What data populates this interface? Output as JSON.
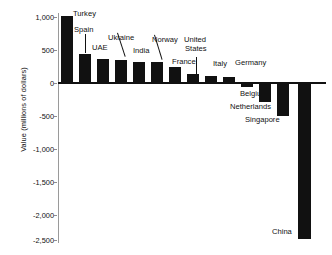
{
  "chart_data": {
    "type": "bar",
    "title": "",
    "xlabel": "",
    "ylabel": "Value (millions of dollars)",
    "ylim": [
      -2500,
      1000
    ],
    "grid": false,
    "legend": null,
    "ytick_labels": [
      "1,000",
      "500",
      "0",
      "-500",
      "-1,000",
      "-1,500",
      "-2,000",
      "-2,500"
    ],
    "ytick_values": [
      1000,
      500,
      0,
      -500,
      -1000,
      -1500,
      -2000,
      -2500
    ],
    "categories": [
      "Turkey",
      "Spain",
      "UAE",
      "Ukraine",
      "India",
      "Norway",
      "France",
      "United States",
      "Italy",
      "Germany",
      "Belgium",
      "Netherlands",
      "Singapore",
      "China"
    ],
    "values": [
      1070,
      470,
      385,
      365,
      340,
      335,
      250,
      145,
      110,
      95,
      -65,
      -300,
      -530,
      -2500
    ],
    "points": [
      {
        "label": "Turkey",
        "value": 1070
      },
      {
        "label": "Spain",
        "value": 470
      },
      {
        "label": "UAE",
        "value": 385
      },
      {
        "label": "Ukraine",
        "value": 365
      },
      {
        "label": "India",
        "value": 340
      },
      {
        "label": "Norway",
        "value": 335
      },
      {
        "label": "France",
        "value": 250
      },
      {
        "label": "United States",
        "value": 145
      },
      {
        "label": "Italy",
        "value": 110
      },
      {
        "label": "Germany",
        "value": 95
      },
      {
        "label": "Belgium",
        "value": -65
      },
      {
        "label": "Netherlands",
        "value": -300
      },
      {
        "label": "Singapore",
        "value": -530
      },
      {
        "label": "China",
        "value": -2500
      }
    ],
    "annotations": [
      {
        "text": "Turkey",
        "kind": "callout",
        "leader": "none"
      },
      {
        "text": "Spain",
        "kind": "callout",
        "leader": "vertical"
      },
      {
        "text": "UAE",
        "kind": "callout",
        "leader": "none"
      },
      {
        "text": "Ukraine",
        "kind": "callout",
        "leader": "diagonal"
      },
      {
        "text": "India",
        "kind": "callout",
        "leader": "none"
      },
      {
        "text": "Norway",
        "kind": "callout",
        "leader": "diagonal"
      },
      {
        "text": "France",
        "kind": "callout",
        "leader": "none"
      },
      {
        "text": "United States",
        "kind": "callout",
        "leader": "vertical"
      },
      {
        "text": "Italy",
        "kind": "callout",
        "leader": "none"
      },
      {
        "text": "Germany",
        "kind": "callout",
        "leader": "none"
      },
      {
        "text": "Belgium",
        "kind": "callout",
        "leader": "none"
      },
      {
        "text": "Netherlands",
        "kind": "callout",
        "leader": "none"
      },
      {
        "text": "Singapore",
        "kind": "callout",
        "leader": "none"
      },
      {
        "text": "China",
        "kind": "callout",
        "leader": "none"
      }
    ],
    "colors": {
      "bar": "#111111",
      "axis": "#9a9a9a",
      "text": "#111111",
      "background": "#ffffff"
    }
  },
  "labels": {
    "turkey": "Turkey",
    "spain": "Spain",
    "uae": "UAE",
    "ukraine": "Ukraine",
    "india": "India",
    "norway": "Norway",
    "france": "France",
    "united_states_line1": "United",
    "united_states_line2": "States",
    "italy": "Italy",
    "germany": "Germany",
    "belgium": "Belgium",
    "netherlands": "Netherlands",
    "singapore": "Singapore",
    "china": "China"
  },
  "axis": {
    "y_title": "Value (millions of dollars)",
    "t0": "1,000",
    "t1": "500",
    "t2": "0",
    "t3": "-500",
    "t4": "-1,000",
    "t5": "-1,500",
    "t6": "-2,000",
    "t7": "-2,500"
  }
}
